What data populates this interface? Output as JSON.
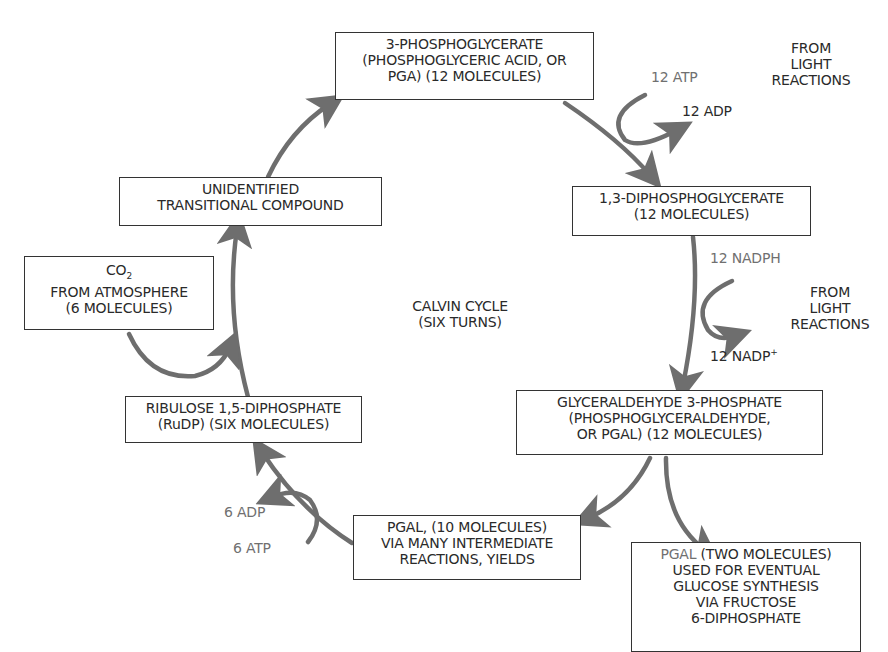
{
  "title": "Calvin Cycle",
  "center_label": {
    "line1": "CALVIN CYCLE",
    "line2": "(SIX TURNS)"
  },
  "nodes": {
    "pga": {
      "line1": "3-PHOSPHOGLYCERATE",
      "line2": "(PHOSPHOGLYCERIC ACID, OR",
      "line3": "PGA) (12 MOLECULES)"
    },
    "dpg": {
      "line1": "1,3-DIPHOSPHOGLYCERATE",
      "line2": "(12 MOLECULES)"
    },
    "pgal": {
      "line1": "GLYCERALDEHYDE 3-PHOSPHATE",
      "line2": "(PHOSPHOGLYCERALDEHYDE,",
      "line3": "OR PGAL) (12 MOLECULES)"
    },
    "pgal10": {
      "line1": "PGAL, (10 MOLECULES)",
      "line2": "VIA MANY INTERMEDIATE",
      "line3": "REACTIONS, YIELDS"
    },
    "pgal2": {
      "line1_prefix": "PGAL",
      "line1_rest": " (TWO MOLECULES)",
      "line2": "USED FOR EVENTUAL",
      "line3": "GLUCOSE SYNTHESIS",
      "line4": "VIA FRUCTOSE",
      "line5": "6-DIPHOSPHATE"
    },
    "rudp": {
      "line1": "RIBULOSE 1,5-DIPHOSPHATE",
      "line2": "(RuDP) (SIX MOLECULES)"
    },
    "co2": {
      "line1": "CO",
      "line1_sub": "2",
      "line2": "FROM ATMOSPHERE",
      "line3": "(6 MOLECULES)"
    },
    "transitional": {
      "line1": "UNIDENTIFIED",
      "line2": "TRANSITIONAL COMPOUND"
    }
  },
  "side_labels": {
    "atp12": "12 ATP",
    "adp12": "12 ADP",
    "light1": {
      "line1": "FROM",
      "line2": "LIGHT",
      "line3": "REACTIONS"
    },
    "nadph12": "12 NADPH",
    "nadp12": "12 NADP",
    "nadp12_sup": "+",
    "light2": {
      "line1": "FROM",
      "line2": "LIGHT",
      "line3": "REACTIONS"
    },
    "adp6": "6 ADP",
    "atp6": "6 ATP"
  },
  "colors": {
    "arrow": "#6e6e6e",
    "text": "#2a2a2a",
    "gray_text": "#707070",
    "border": "#333333"
  }
}
